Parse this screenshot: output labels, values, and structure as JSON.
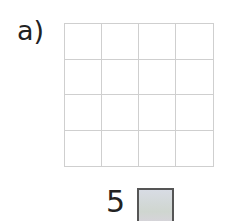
{
  "question": {
    "label": "a)",
    "grid": {
      "rows": 4,
      "cols": 4
    },
    "answer_prefix": "5",
    "answer_box_color": "#d6dae0"
  }
}
